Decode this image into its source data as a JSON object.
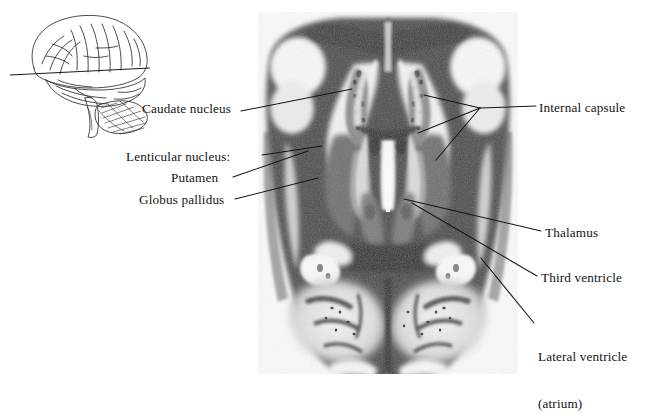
{
  "figure": {
    "type": "anatomical-photograph-with-labels",
    "plane": "horizontal (axial) section",
    "background_color": "#ffffff",
    "label_color": "#141414",
    "leader_color": "#1a1a1a"
  },
  "orientation_key": {
    "name": "lateral-brain-line-drawing",
    "description": "Left lateral view of the brain with a horizontal line indicating the plane of section",
    "parts": [
      "cerebral hemisphere",
      "temporal lobe",
      "cerebellum",
      "brainstem"
    ],
    "section_plane_line": true
  },
  "labels": {
    "left": [
      {
        "id": "caudate",
        "text": "Caudate nucleus",
        "leaders": 1
      },
      {
        "id": "lenticular",
        "text": "Lenticular nucleus:",
        "leaders": 1
      },
      {
        "id": "putamen",
        "text": "Putamen",
        "leaders": 1
      },
      {
        "id": "globus",
        "text": "Globus pallidus",
        "leaders": 1
      }
    ],
    "right": [
      {
        "id": "internal",
        "text": "Internal capsule",
        "leaders": 3
      },
      {
        "id": "thalamus",
        "text": "Thalamus",
        "leaders": 1
      },
      {
        "id": "third",
        "text": "Third ventricle",
        "leaders": 1
      },
      {
        "id": "lateral_1",
        "text": "Lateral ventricle",
        "leaders": 1
      },
      {
        "id": "lateral_2",
        "text": "(atrium)",
        "leaders": 0
      }
    ]
  },
  "photo": {
    "name": "horizontal-brain-section-photo",
    "x": 258,
    "y": 12,
    "width": 260,
    "height": 362,
    "tone_dark": "#3a3a3a",
    "tone_mid": "#8a8a8a",
    "tone_light": "#e8e8e8",
    "tone_white": "#fbfbfb"
  }
}
